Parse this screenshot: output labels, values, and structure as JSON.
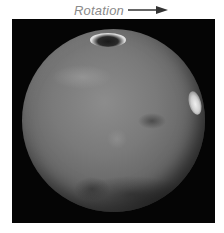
{
  "caption": {
    "label": "Rotation",
    "arrow_icon": "right-arrow-icon",
    "color": "#8a8a8a"
  },
  "image": {
    "subject": "planet-mars",
    "background_color": "#050505",
    "features": [
      "north-polar-cap",
      "bright-limb-cloud",
      "dark-surface-markings"
    ]
  }
}
